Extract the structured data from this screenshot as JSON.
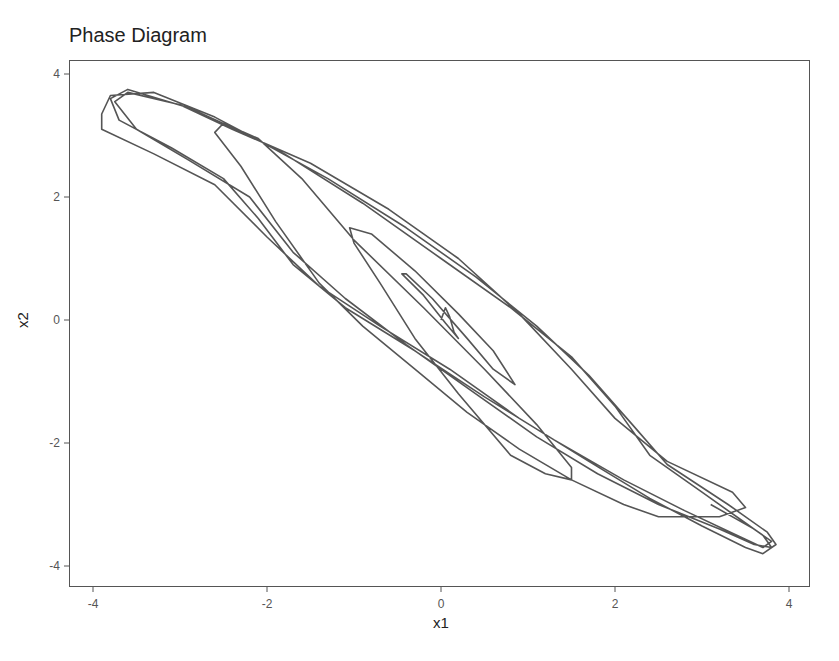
{
  "chart_data": {
    "type": "line",
    "title": "Phase Diagram",
    "xlabel": "x1",
    "ylabel": "x2",
    "xlim": [
      -4.2,
      4.3
    ],
    "ylim": [
      -4.3,
      4.3
    ],
    "xticks": [
      -4,
      -2,
      0,
      2,
      4
    ],
    "yticks": [
      -4,
      -2,
      0,
      2,
      4
    ],
    "xtick_labels": [
      "-4",
      "-2",
      "0",
      "2",
      "4"
    ],
    "ytick_labels": [
      "-4",
      "-2",
      "0",
      "2",
      "4"
    ],
    "grid": false,
    "legend": null,
    "line_color": "#555555",
    "series": [
      {
        "name": "trajectory",
        "points": [
          [
            0.0,
            0.0
          ],
          [
            0.05,
            0.2
          ],
          [
            0.1,
            0.05
          ],
          [
            0.15,
            -0.2
          ],
          [
            0.2,
            -0.3
          ],
          [
            0.05,
            -0.05
          ],
          [
            -0.2,
            0.4
          ],
          [
            -0.45,
            0.75
          ],
          [
            -0.4,
            0.75
          ],
          [
            -0.1,
            0.35
          ],
          [
            0.3,
            -0.3
          ],
          [
            0.6,
            -0.8
          ],
          [
            0.85,
            -1.05
          ],
          [
            0.6,
            -0.5
          ],
          [
            0.2,
            0.1
          ],
          [
            -0.3,
            0.8
          ],
          [
            -0.8,
            1.4
          ],
          [
            -1.05,
            1.5
          ],
          [
            -1.0,
            1.25
          ],
          [
            -0.7,
            0.6
          ],
          [
            -0.3,
            -0.3
          ],
          [
            0.2,
            -1.2
          ],
          [
            0.8,
            -2.2
          ],
          [
            1.2,
            -2.5
          ],
          [
            1.5,
            -2.6
          ],
          [
            1.5,
            -2.4
          ],
          [
            1.1,
            -1.7
          ],
          [
            0.5,
            -0.8
          ],
          [
            -0.2,
            0.2
          ],
          [
            -1.0,
            1.3
          ],
          [
            -1.6,
            2.3
          ],
          [
            -2.1,
            2.95
          ],
          [
            -2.5,
            3.2
          ],
          [
            -2.6,
            3.05
          ],
          [
            -2.3,
            2.5
          ],
          [
            -1.9,
            1.6
          ],
          [
            -1.4,
            0.6
          ],
          [
            -0.9,
            -0.1
          ],
          [
            -0.3,
            -0.8
          ],
          [
            0.3,
            -1.5
          ],
          [
            0.9,
            -2.1
          ],
          [
            1.5,
            -2.6
          ],
          [
            2.1,
            -3.0
          ],
          [
            2.5,
            -3.2
          ],
          [
            3.2,
            -3.2
          ],
          [
            3.5,
            -3.05
          ],
          [
            3.35,
            -2.8
          ],
          [
            2.6,
            -2.3
          ],
          [
            2.0,
            -1.6
          ],
          [
            1.5,
            -0.8
          ],
          [
            0.9,
            0.1
          ],
          [
            0.2,
            1.0
          ],
          [
            -0.6,
            1.8
          ],
          [
            -1.5,
            2.55
          ],
          [
            -2.4,
            3.1
          ],
          [
            -3.0,
            3.5
          ],
          [
            -3.6,
            3.7
          ],
          [
            -3.75,
            3.55
          ],
          [
            -3.5,
            3.1
          ],
          [
            -2.9,
            2.6
          ],
          [
            -2.2,
            2.0
          ],
          [
            -1.7,
            1.1
          ],
          [
            -1.1,
            0.35
          ],
          [
            -0.4,
            -0.4
          ],
          [
            0.4,
            -1.2
          ],
          [
            1.1,
            -1.9
          ],
          [
            1.8,
            -2.5
          ],
          [
            2.5,
            -3.0
          ],
          [
            3.2,
            -3.4
          ],
          [
            3.6,
            -3.65
          ],
          [
            3.8,
            -3.7
          ],
          [
            3.7,
            -3.5
          ],
          [
            3.5,
            -3.3
          ],
          [
            3.0,
            -2.8
          ],
          [
            2.4,
            -2.2
          ],
          [
            2.0,
            -1.4
          ],
          [
            1.5,
            -0.6
          ],
          [
            0.8,
            0.2
          ],
          [
            0.0,
            1.0
          ],
          [
            -0.9,
            1.9
          ],
          [
            -1.8,
            2.7
          ],
          [
            -2.6,
            3.3
          ],
          [
            -3.3,
            3.7
          ],
          [
            -3.8,
            3.65
          ],
          [
            -3.9,
            3.35
          ],
          [
            -3.9,
            3.1
          ],
          [
            -3.3,
            2.7
          ],
          [
            -2.6,
            2.2
          ],
          [
            -2.0,
            1.35
          ],
          [
            -1.4,
            0.55
          ],
          [
            -0.7,
            -0.1
          ],
          [
            0.1,
            -0.8
          ],
          [
            0.9,
            -1.6
          ],
          [
            1.7,
            -2.3
          ],
          [
            2.4,
            -2.9
          ],
          [
            3.0,
            -3.35
          ],
          [
            3.5,
            -3.7
          ],
          [
            3.7,
            -3.8
          ],
          [
            3.85,
            -3.65
          ],
          [
            3.75,
            -3.45
          ],
          [
            3.3,
            -3.0
          ],
          [
            2.6,
            -2.35
          ],
          [
            2.2,
            -1.7
          ],
          [
            1.7,
            -0.9
          ],
          [
            1.1,
            -0.1
          ],
          [
            0.4,
            0.7
          ],
          [
            -0.4,
            1.5
          ],
          [
            -1.3,
            2.3
          ],
          [
            -2.2,
            3.0
          ],
          [
            -2.9,
            3.45
          ],
          [
            -3.6,
            3.75
          ],
          [
            -3.8,
            3.6
          ],
          [
            -3.7,
            3.25
          ],
          [
            -3.1,
            2.8
          ],
          [
            -2.5,
            2.3
          ],
          [
            -2.1,
            1.65
          ],
          [
            -1.7,
            0.9
          ],
          [
            -1.1,
            0.2
          ],
          [
            -0.3,
            -0.5
          ],
          [
            0.5,
            -1.25
          ],
          [
            1.3,
            -1.95
          ],
          [
            2.1,
            -2.6
          ],
          [
            2.8,
            -3.1
          ],
          [
            3.4,
            -3.5
          ],
          [
            3.7,
            -3.7
          ],
          [
            3.8,
            -3.6
          ],
          [
            3.6,
            -3.4
          ],
          [
            3.1,
            -3.0
          ]
        ]
      }
    ]
  },
  "title": "Phase Diagram",
  "axes": {
    "xlabel": "x1",
    "ylabel": "x2"
  }
}
